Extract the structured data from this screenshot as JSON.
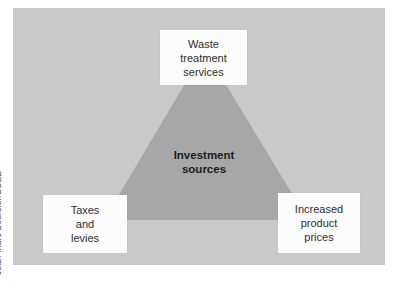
{
  "credit": "Jean-Marc Boursier/SUEZ",
  "colors": {
    "page_bg": "#ffffff",
    "panel_bg": "#c9c9c9",
    "triangle_fill": "#a7a7a7",
    "node_bg": "#fcfcfc",
    "node_text": "#2e2e2e",
    "center_text": "#1c1c1c",
    "credit_text": "#4d4d4d"
  },
  "diagram": {
    "center": {
      "lines": [
        "Investment",
        "sources"
      ]
    },
    "nodes": [
      {
        "id": "waste-treatment-services",
        "lines": [
          "Waste",
          "treatment",
          "services"
        ]
      },
      {
        "id": "taxes-and-levies",
        "lines": [
          "Taxes",
          "and",
          "levies"
        ]
      },
      {
        "id": "increased-product-prices",
        "lines": [
          "Increased",
          "product",
          "prices"
        ]
      }
    ]
  }
}
